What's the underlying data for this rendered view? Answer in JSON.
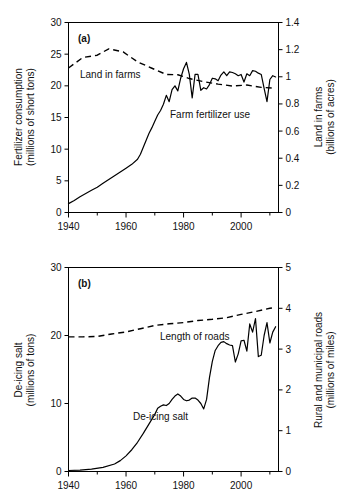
{
  "figure": {
    "panels": [
      {
        "tag": "(a)",
        "left_axis": {
          "title_line1": "Fertilizer consumption",
          "title_line2": "(millions of short tons)",
          "ticks": [
            "0",
            "5",
            "10",
            "15",
            "20",
            "25",
            "30"
          ],
          "min": 0,
          "max": 30
        },
        "right_axis": {
          "title_line1": "Land in farms",
          "title_line2": "(billions of acres)",
          "ticks": [
            "0",
            "0.2",
            "0.4",
            "0.6",
            "0.8",
            "1",
            "1.2",
            "1.4"
          ],
          "min": 0,
          "max": 1.4
        },
        "x_axis": {
          "ticks": [
            "1940",
            "1960",
            "1980",
            "2000"
          ],
          "min": 1940,
          "max": 2013
        },
        "series_labels": {
          "solid": "Farm fertilizer use",
          "dashed": "Land in farms"
        }
      },
      {
        "tag": "(b)",
        "left_axis": {
          "title_line1": "De-icing salt",
          "title_line2": "(millions of tons)",
          "ticks": [
            "0",
            "10",
            "20",
            "30"
          ],
          "min": 0,
          "max": 30
        },
        "right_axis": {
          "title_line1": "Rural and municipal roads",
          "title_line2": "(millions of miles)",
          "ticks": [
            "0",
            "1",
            "2",
            "3",
            "4",
            "5"
          ],
          "min": 0,
          "max": 5
        },
        "x_axis": {
          "ticks": [
            "1940",
            "1960",
            "1980",
            "2000"
          ],
          "min": 1940,
          "max": 2013
        },
        "series_labels": {
          "solid": "De-icing salt",
          "dashed": "Length of roads"
        }
      }
    ]
  },
  "chart_data": [
    {
      "type": "line",
      "title": "(a)",
      "xlabel": "",
      "ylabel": "Fertilizer consumption (millions of short tons)",
      "y2label": "Land in farms (billions of acres)",
      "xlim": [
        1940,
        2013
      ],
      "ylim": [
        0,
        30
      ],
      "y2lim": [
        0,
        1.4
      ],
      "grid": false,
      "legend": "inline-annotations",
      "series": [
        {
          "name": "Farm fertilizer use",
          "axis": "left",
          "style": "solid",
          "units": "millions of short tons",
          "x": [
            1940,
            1942,
            1944,
            1946,
            1948,
            1950,
            1952,
            1954,
            1956,
            1958,
            1960,
            1962,
            1964,
            1965,
            1966,
            1967,
            1968,
            1969,
            1970,
            1971,
            1972,
            1973,
            1974,
            1975,
            1976,
            1977,
            1978,
            1979,
            1980,
            1981,
            1982,
            1983,
            1984,
            1985,
            1986,
            1987,
            1988,
            1989,
            1990,
            1991,
            1992,
            1993,
            1994,
            1995,
            1996,
            1997,
            1998,
            1999,
            2000,
            2001,
            2002,
            2003,
            2004,
            2005,
            2006,
            2007,
            2008,
            2009,
            2010,
            2011,
            2012
          ],
          "y": [
            1.4,
            1.9,
            2.5,
            3.0,
            3.5,
            4.0,
            4.6,
            5.2,
            5.8,
            6.4,
            7.0,
            7.6,
            8.4,
            9.2,
            10.3,
            11.4,
            12.5,
            13.4,
            14.4,
            15.4,
            16.1,
            17.1,
            18.5,
            17.5,
            19.4,
            20.0,
            19.2,
            21.2,
            22.7,
            23.7,
            21.8,
            18.1,
            21.8,
            21.8,
            19.3,
            19.7,
            19.5,
            20.2,
            21.2,
            21.1,
            20.8,
            21.7,
            22.2,
            21.6,
            22.2,
            22.1,
            21.9,
            21.6,
            21.8,
            20.6,
            21.9,
            21.6,
            22.4,
            22.3,
            22.0,
            21.8,
            19.6,
            17.5,
            21.0,
            21.6,
            21.4
          ]
        },
        {
          "name": "Land in farms",
          "axis": "right",
          "style": "dashed",
          "units": "billions of acres",
          "x": [
            1940,
            1945,
            1950,
            1954,
            1959,
            1964,
            1969,
            1974,
            1978,
            1982,
            1987,
            1992,
            1997,
            2002,
            2007,
            2012
          ],
          "y": [
            1.065,
            1.142,
            1.159,
            1.206,
            1.183,
            1.11,
            1.063,
            1.017,
            1.015,
            0.987,
            0.964,
            0.946,
            0.932,
            0.939,
            0.922,
            0.915
          ]
        }
      ]
    },
    {
      "type": "line",
      "title": "(b)",
      "xlabel": "",
      "ylabel": "De-icing salt (millions of tons)",
      "y2label": "Rural and municipal roads (millions of miles)",
      "xlim": [
        1940,
        2013
      ],
      "ylim": [
        0,
        30
      ],
      "y2lim": [
        0,
        5
      ],
      "grid": false,
      "legend": "inline-annotations",
      "series": [
        {
          "name": "De-icing salt",
          "axis": "left",
          "style": "solid",
          "units": "millions of tons",
          "x": [
            1940,
            1944,
            1948,
            1952,
            1956,
            1958,
            1960,
            1962,
            1964,
            1966,
            1968,
            1970,
            1971,
            1972,
            1973,
            1974,
            1975,
            1976,
            1977,
            1978,
            1979,
            1980,
            1981,
            1982,
            1983,
            1984,
            1985,
            1986,
            1987,
            1988,
            1989,
            1990,
            1991,
            1992,
            1993,
            1994,
            1995,
            1996,
            1997,
            1998,
            1999,
            2000,
            2001,
            2002,
            2003,
            2004,
            2005,
            2006,
            2007,
            2008,
            2009,
            2010,
            2011,
            2012
          ],
          "y": [
            0.15,
            0.2,
            0.35,
            0.6,
            1.1,
            1.6,
            2.3,
            3.2,
            4.3,
            5.6,
            7.0,
            8.4,
            9.3,
            9.6,
            9.8,
            9.7,
            10.0,
            10.6,
            11.1,
            11.4,
            11.1,
            10.6,
            10.4,
            10.5,
            10.8,
            10.8,
            10.5,
            10.0,
            9.2,
            10.6,
            13.8,
            16.2,
            17.8,
            18.5,
            19.0,
            19.1,
            18.8,
            18.6,
            18.5,
            16.1,
            17.3,
            19.2,
            19.3,
            17.7,
            21.7,
            20.5,
            22.5,
            16.9,
            17.1,
            20.0,
            21.9,
            18.9,
            20.5,
            21.3
          ]
        },
        {
          "name": "Length of roads",
          "axis": "right",
          "style": "dashed",
          "units": "millions of miles",
          "x": [
            1940,
            1945,
            1950,
            1955,
            1960,
            1965,
            1970,
            1975,
            1980,
            1985,
            1990,
            1995,
            2000,
            2005,
            2010,
            2012
          ],
          "y": [
            3.3,
            3.3,
            3.31,
            3.37,
            3.42,
            3.5,
            3.58,
            3.62,
            3.65,
            3.7,
            3.73,
            3.77,
            3.85,
            3.92,
            4.0,
            4.02
          ]
        }
      ]
    }
  ]
}
